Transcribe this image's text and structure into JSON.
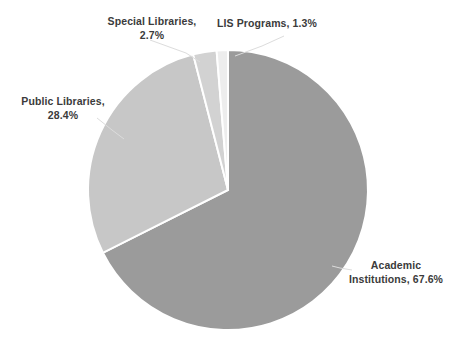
{
  "chart_data": {
    "type": "pie",
    "title": "",
    "subtitle": "",
    "xlabel": "",
    "ylabel": "",
    "legend_position": "none",
    "grid": false,
    "labels_inline": true,
    "categories": [
      "Academic Institutions",
      "Public Libraries",
      "Special Libraries",
      "LIS Programs"
    ],
    "values": [
      67.6,
      28.4,
      2.7,
      1.3
    ],
    "units": "percent",
    "slices": [
      {
        "name": "Academic Institutions",
        "value": 67.6,
        "value_label": "67.6%",
        "label_text": "Academic\nInstitutions, 67.6%",
        "color": "#9b9b9b",
        "start_angle_deg": 0,
        "end_angle_deg": 243.36
      },
      {
        "name": "Public Libraries",
        "value": 28.4,
        "value_label": "28.4%",
        "label_text": "Public Libraries,\n28.4%",
        "color": "#c7c7c7",
        "start_angle_deg": 243.36,
        "end_angle_deg": 345.6
      },
      {
        "name": "Special Libraries",
        "value": 2.7,
        "value_label": "2.7%",
        "label_text": "Special Libraries,\n2.7%",
        "color": "#d2d2d2",
        "start_angle_deg": 345.6,
        "end_angle_deg": 355.32
      },
      {
        "name": "LIS Programs",
        "value": 1.3,
        "value_label": "1.3%",
        "label_text": "LIS Programs, 1.3%",
        "color": "#ededed",
        "start_angle_deg": 355.32,
        "end_angle_deg": 360
      }
    ]
  },
  "colors": {
    "background": "#ffffff",
    "text": "#3b3b3b",
    "slice_academic": "#9b9b9b",
    "slice_public": "#c7c7c7",
    "slice_special": "#d2d2d2",
    "slice_lis": "#ededed",
    "slice_separator": "#ffffff",
    "leader_line": "#d8d8d8"
  },
  "geometry": {
    "center_x": 228,
    "center_y": 190,
    "radius": 140
  }
}
